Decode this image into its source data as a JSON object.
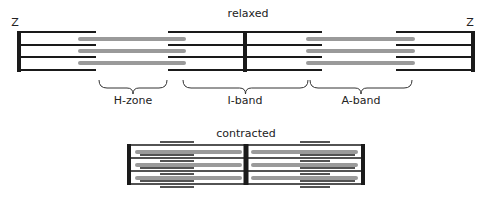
{
  "colors": {
    "line": "#1a1a1a",
    "thick": "#9a9a9a",
    "text": "#222222",
    "background": "#ffffff"
  },
  "relaxed": {
    "title": "relaxed",
    "title_pos": [
      248,
      17
    ],
    "z_label": "Z",
    "z_label_left_pos": [
      15,
      26
    ],
    "z_label_right_pos": [
      470,
      26
    ],
    "y_lines": [
      32,
      45,
      57,
      70
    ],
    "y_thick": [
      39,
      51,
      63
    ],
    "z_lines": [
      {
        "x": 19,
        "y1": 31,
        "y2": 72,
        "w": 4
      },
      {
        "x": 245,
        "y1": 31,
        "y2": 72,
        "w": 4
      },
      {
        "x": 473,
        "y1": 31,
        "y2": 72,
        "w": 4
      }
    ],
    "thin_filaments": [
      {
        "x1": 19,
        "x2": 96,
        "rows": [
          0,
          1,
          2,
          3
        ]
      },
      {
        "x1": 168,
        "x2": 245,
        "rows": [
          0,
          1,
          2,
          3
        ]
      },
      {
        "x1": 245,
        "x2": 322,
        "rows": [
          0,
          1,
          2,
          3
        ]
      },
      {
        "x1": 396,
        "x2": 473,
        "rows": [
          0,
          1,
          2,
          3
        ]
      }
    ],
    "thick_filaments": [
      {
        "x1": 80,
        "x2": 184
      },
      {
        "x1": 308,
        "x2": 413
      }
    ]
  },
  "bands": [
    {
      "label": "H-zone",
      "x1": 99,
      "x2": 167,
      "label_x": 133
    },
    {
      "label": "I-band",
      "x1": 183,
      "x2": 308,
      "label_x": 245
    },
    {
      "label": "A-band",
      "x1": 310,
      "x2": 412,
      "label_x": 361
    }
  ],
  "bands_y": 80,
  "bands_label_y": 104,
  "contracted": {
    "title": "contracted",
    "title_pos": [
      246,
      137
    ],
    "y_lines": [
      145,
      158,
      171,
      184
    ],
    "y_thick": [
      152,
      165,
      178
    ],
    "z_lines": [
      {
        "x": 129,
        "y1": 144,
        "y2": 185,
        "w": 4
      },
      {
        "x": 246,
        "y1": 144,
        "y2": 185,
        "w": 5
      },
      {
        "x": 363,
        "y1": 144,
        "y2": 185,
        "w": 4
      }
    ],
    "box_lines": [
      {
        "x1": 129,
        "x2": 363,
        "y": 145
      },
      {
        "x1": 129,
        "x2": 363,
        "y": 158
      },
      {
        "x1": 129,
        "x2": 363,
        "y": 171
      },
      {
        "x1": 129,
        "x2": 363,
        "y": 184
      }
    ],
    "thin_filaments": [
      {
        "x1": 160,
        "x2": 194,
        "y": 142
      },
      {
        "x1": 140,
        "x2": 194,
        "y": 155
      },
      {
        "x1": 160,
        "x2": 194,
        "y": 161
      },
      {
        "x1": 140,
        "x2": 194,
        "y": 168
      },
      {
        "x1": 160,
        "x2": 194,
        "y": 174
      },
      {
        "x1": 140,
        "x2": 194,
        "y": 181
      },
      {
        "x1": 160,
        "x2": 194,
        "y": 187
      },
      {
        "x1": 300,
        "x2": 330,
        "y": 142
      },
      {
        "x1": 300,
        "x2": 355,
        "y": 155
      },
      {
        "x1": 300,
        "x2": 330,
        "y": 161
      },
      {
        "x1": 300,
        "x2": 355,
        "y": 168
      },
      {
        "x1": 300,
        "x2": 330,
        "y": 174
      },
      {
        "x1": 300,
        "x2": 355,
        "y": 181
      },
      {
        "x1": 300,
        "x2": 330,
        "y": 187
      }
    ],
    "thick_filaments": [
      {
        "x1": 137,
        "x2": 240
      },
      {
        "x1": 253,
        "x2": 356
      }
    ]
  }
}
